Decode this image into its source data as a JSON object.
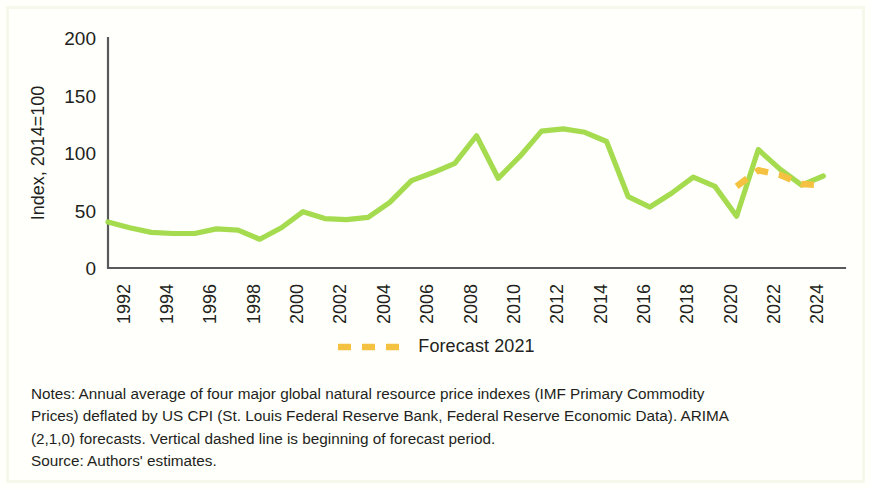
{
  "figure": {
    "background_color": "#ffffff",
    "frame_color": "#f7f8ec"
  },
  "legend": {
    "position": "bottom-center",
    "swatch_name": "forecast-dashed-line-swatch",
    "label": "Forecast 2021",
    "color": "#f5c141"
  },
  "notes": {
    "line1": "Notes: Annual average of four major global natural resource price indexes (IMF Primary Commodity",
    "line2": "Prices) deflated by US CPI (St. Louis Federal Reserve Bank, Federal Reserve Economic Data). ARIMA",
    "line3": "(2,1,0) forecasts. Vertical dashed line is beginning of forecast period.",
    "line4": "Source: Authors' estimates."
  },
  "chart_data": {
    "type": "line",
    "title": "",
    "xlabel": "",
    "ylabel": "Index, 2014=100",
    "ylim": [
      0,
      200
    ],
    "yticks": [
      0,
      50,
      100,
      150,
      200
    ],
    "ytick_labels": [
      "0",
      "50",
      "100",
      "150",
      "200"
    ],
    "xlim": [
      1991,
      2025
    ],
    "xticks": [
      1992,
      1994,
      1996,
      1998,
      2000,
      2002,
      2004,
      2006,
      2008,
      2010,
      2012,
      2014,
      2016,
      2018,
      2020,
      2022,
      2024
    ],
    "xtick_labels": [
      "1992",
      "1994",
      "1996",
      "1998",
      "2000",
      "2002",
      "2004",
      "2006",
      "2008",
      "2010",
      "2012",
      "2014",
      "2016",
      "2018",
      "2020",
      "2022",
      "2024"
    ],
    "xtick_rotation": 90,
    "grid": false,
    "x": [
      1991,
      1992,
      1993,
      1994,
      1995,
      1996,
      1997,
      1998,
      1999,
      2000,
      2001,
      2002,
      2003,
      2004,
      2005,
      2006,
      2007,
      2008,
      2009,
      2010,
      2011,
      2012,
      2013,
      2014,
      2015,
      2016,
      2017,
      2018,
      2019,
      2020,
      2021,
      2022,
      2023,
      2024
    ],
    "series": [
      {
        "name": "Actual index",
        "color": "#a5db4e",
        "style": "solid",
        "values": [
          40,
          35,
          31,
          30,
          30,
          34,
          33,
          25,
          35,
          49,
          43,
          42,
          44,
          57,
          76,
          83,
          91,
          115,
          78,
          97,
          119,
          121,
          118,
          110,
          62,
          53,
          65,
          79,
          71,
          45,
          103,
          86,
          72,
          80
        ]
      },
      {
        "name": "Forecast 2021",
        "color": "#f5c141",
        "style": "dashed",
        "x": [
          2020,
          2021,
          2022,
          2023,
          2024
        ],
        "values": [
          71,
          85,
          81,
          73,
          72
        ]
      }
    ],
    "annotations": []
  }
}
